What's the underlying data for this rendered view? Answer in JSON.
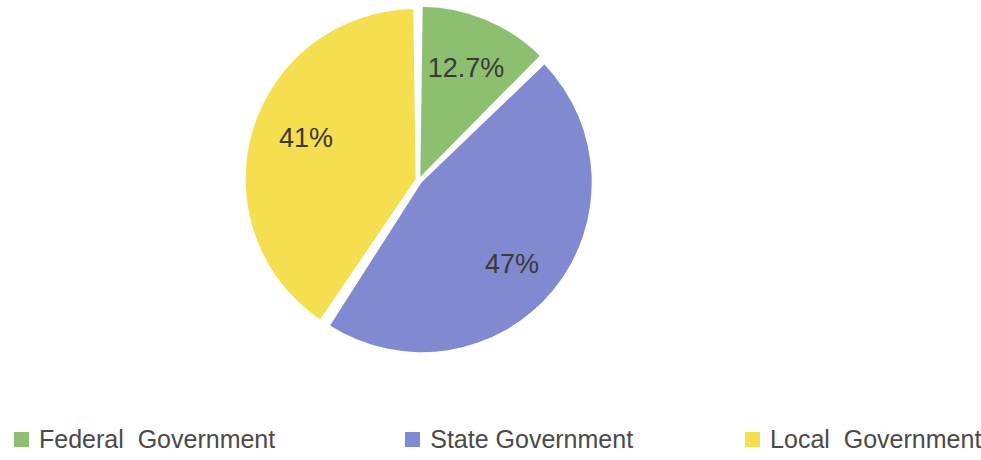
{
  "chart_data": {
    "type": "pie",
    "title": "",
    "categories": [
      "Federal Government",
      "State Government",
      "Local Government"
    ],
    "values": [
      12.7,
      47,
      41
    ],
    "labels": [
      "12.7%",
      "47%",
      "41%"
    ],
    "colors": [
      "#8DBF70",
      "#8189D0",
      "#F5DE4F"
    ],
    "unit": "%",
    "legend_position": "bottom",
    "start_angle_deg": 0,
    "direction": "clockwise",
    "separator_color": "#FFFFFF",
    "label_color": "#3A3A38",
    "background": "#FFFFFF"
  },
  "pie": {
    "center_x": 419,
    "center_y": 180,
    "radius": 170,
    "slices": [
      {
        "name": "Federal Government",
        "label": "12.7%",
        "value": 12.7,
        "color": "#8DBF70",
        "label_x": 466,
        "label_y": 70
      },
      {
        "name": "State Government",
        "label": "47%",
        "value": 47,
        "color": "#8189D0",
        "label_x": 512,
        "label_y": 266
      },
      {
        "name": "Local Government",
        "label": "41%",
        "value": 41,
        "color": "#F5DE4F",
        "label_x": 306,
        "label_y": 140
      }
    ]
  },
  "legend": {
    "items": [
      {
        "label": "Federal  Government",
        "color": "#8DBF70"
      },
      {
        "label": "State Government",
        "color": "#8189D0"
      },
      {
        "label": "Local  Government",
        "color": "#F5DE4F"
      }
    ]
  }
}
